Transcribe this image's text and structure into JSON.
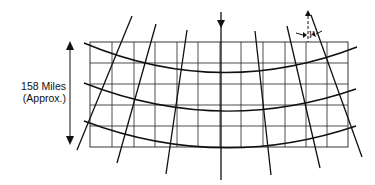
{
  "diagram": {
    "type": "map-projection-grid",
    "distance_label": {
      "line1": "158 Miles",
      "line2": "(Approx.)"
    },
    "angle_label": "γ",
    "central_meridian_arrow": "down",
    "grid": {
      "columns": 12,
      "rows": 5
    },
    "meridian_count": 7,
    "parallel_count": 3,
    "colors": {
      "line": "#111111",
      "background": "#ffffff"
    }
  }
}
